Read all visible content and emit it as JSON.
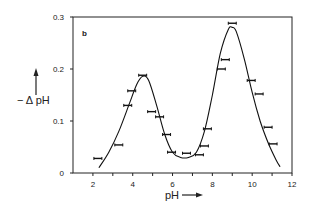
{
  "chart_data": {
    "type": "line",
    "title": "",
    "panel_label": "b",
    "xlabel": "pH",
    "ylabel": "− ΔpH",
    "xlim": [
      1,
      12
    ],
    "ylim": [
      0,
      0.3
    ],
    "x_ticks": [
      2,
      4,
      6,
      8,
      10,
      12
    ],
    "x_minor_ticks": [
      3,
      5,
      7,
      9,
      11
    ],
    "y_ticks": [
      0,
      0.1,
      0.2,
      0.3
    ],
    "y_tick_labels": [
      "0",
      "0.1",
      "0.2",
      "0.3"
    ],
    "x_tick_labels": [
      "2",
      "4",
      "6",
      "8",
      "10",
      "12"
    ],
    "grid": false,
    "legend": null,
    "series": [
      {
        "name": "measured",
        "style": "horizontal error bars",
        "x": [
          2.25,
          3.3,
          3.75,
          3.95,
          4.5,
          4.95,
          5.35,
          5.7,
          5.95,
          6.7,
          7.35,
          7.6,
          7.75,
          8.45,
          8.65,
          9.0,
          9.95,
          10.35,
          10.8,
          11.05
        ],
        "values": [
          0.028,
          0.054,
          0.13,
          0.158,
          0.188,
          0.118,
          0.108,
          0.074,
          0.04,
          0.038,
          0.035,
          0.052,
          0.085,
          0.2,
          0.218,
          0.288,
          0.178,
          0.152,
          0.088,
          0.056
        ],
        "x_err": 0.2
      },
      {
        "name": "fit curve",
        "style": "solid line",
        "x": [
          2.3,
          2.8,
          3.3,
          3.8,
          4.2,
          4.5,
          4.8,
          5.2,
          5.6,
          6.0,
          6.4,
          6.8,
          7.2,
          7.6,
          8.0,
          8.4,
          8.8,
          9.0,
          9.2,
          9.6,
          10.0,
          10.4,
          10.8,
          11.2,
          11.4
        ],
        "values": [
          0.01,
          0.04,
          0.08,
          0.13,
          0.17,
          0.186,
          0.178,
          0.13,
          0.075,
          0.04,
          0.03,
          0.03,
          0.04,
          0.08,
          0.15,
          0.23,
          0.276,
          0.28,
          0.272,
          0.22,
          0.155,
          0.1,
          0.058,
          0.025,
          0.012
        ]
      }
    ]
  },
  "labels": {
    "ylabel": "− Δ pH",
    "xlabel": "pH",
    "panel": "b"
  },
  "colors": {
    "axis": "#222222",
    "line": "#111111",
    "background": "#ffffff"
  }
}
